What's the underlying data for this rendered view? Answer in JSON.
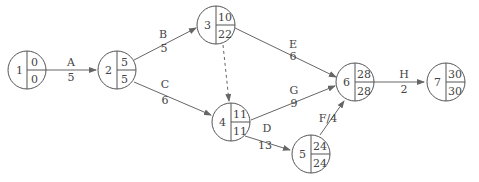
{
  "diagram": {
    "type": "activity-on-arrow network (critical path)",
    "nodes": [
      {
        "id": "1",
        "es": "0",
        "ls": "0",
        "cx": 27,
        "cy": 70
      },
      {
        "id": "2",
        "es": "5",
        "ls": "5",
        "cx": 117,
        "cy": 70
      },
      {
        "id": "3",
        "es": "10",
        "ls": "22",
        "cx": 216,
        "cy": 25
      },
      {
        "id": "4",
        "es": "11",
        "ls": "11",
        "cx": 231,
        "cy": 122
      },
      {
        "id": "5",
        "es": "24",
        "ls": "24",
        "cx": 311,
        "cy": 154
      },
      {
        "id": "6",
        "es": "28",
        "ls": "28",
        "cx": 355,
        "cy": 82
      },
      {
        "id": "7",
        "es": "30",
        "ls": "30",
        "cx": 446,
        "cy": 82
      }
    ],
    "edges": [
      {
        "from": "1",
        "to": "2",
        "activity": "A",
        "duration": "5"
      },
      {
        "from": "2",
        "to": "3",
        "activity": "B",
        "duration": "5"
      },
      {
        "from": "2",
        "to": "4",
        "activity": "C",
        "duration": "6"
      },
      {
        "from": "3",
        "to": "4",
        "activity": "",
        "duration": "",
        "dummy": true
      },
      {
        "from": "3",
        "to": "6",
        "activity": "E",
        "duration": "6"
      },
      {
        "from": "4",
        "to": "6",
        "activity": "G",
        "duration": "9"
      },
      {
        "from": "4",
        "to": "5",
        "activity": "D",
        "duration": "13"
      },
      {
        "from": "5",
        "to": "6",
        "activity": "F",
        "duration": "4",
        "inline_label": "F/4"
      },
      {
        "from": "6",
        "to": "7",
        "activity": "H",
        "duration": "2"
      }
    ]
  }
}
